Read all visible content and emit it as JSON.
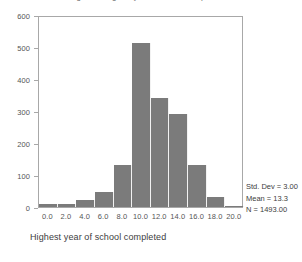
{
  "figure": {
    "background_color": "#ffffff",
    "bar_color": "#7b7b7b",
    "frame_color": "#a8a8a8",
    "text_color": "#3d3d3d"
  },
  "title": "Histogram of highest year of school completed",
  "x_axis_title": "Highest year of school completed",
  "y_tick_labels": [
    "0",
    "100",
    "200",
    "300",
    "400",
    "500",
    "600"
  ],
  "x_tick_labels": [
    "0.0",
    "2.0",
    "4.0",
    "6.0",
    "8.0",
    "10.0",
    "12.0",
    "14.0",
    "16.0",
    "18.0",
    "20.0"
  ],
  "stats": {
    "std_dev": "Std. Dev = 3.00",
    "mean": "Mean = 13.3",
    "n": "N = 1493.00"
  },
  "chart_data": {
    "type": "bar",
    "title": "Histogram of highest year of school completed",
    "xlabel": "Highest year of school completed",
    "ylabel": "",
    "xlim": [
      -1.0,
      21.0
    ],
    "ylim": [
      0,
      600
    ],
    "grid": false,
    "legend": null,
    "bin_width": 2.0,
    "bin_centers": [
      0.0,
      2.0,
      4.0,
      6.0,
      8.0,
      10.0,
      12.0,
      14.0,
      16.0,
      18.0,
      20.0
    ],
    "categories": [
      "0.0",
      "2.0",
      "4.0",
      "6.0",
      "8.0",
      "10.0",
      "12.0",
      "14.0",
      "16.0",
      "18.0",
      "20.0"
    ],
    "values": [
      8,
      10,
      22,
      48,
      132,
      512,
      342,
      290,
      130,
      32,
      4
    ],
    "y_ticks": [
      0,
      100,
      200,
      300,
      400,
      500,
      600
    ],
    "x_ticks": [
      0.0,
      2.0,
      4.0,
      6.0,
      8.0,
      10.0,
      12.0,
      14.0,
      16.0,
      18.0,
      20.0
    ],
    "annotations": [
      "Std. Dev = 3.00",
      "Mean = 13.3",
      "N = 1493.00"
    ]
  }
}
